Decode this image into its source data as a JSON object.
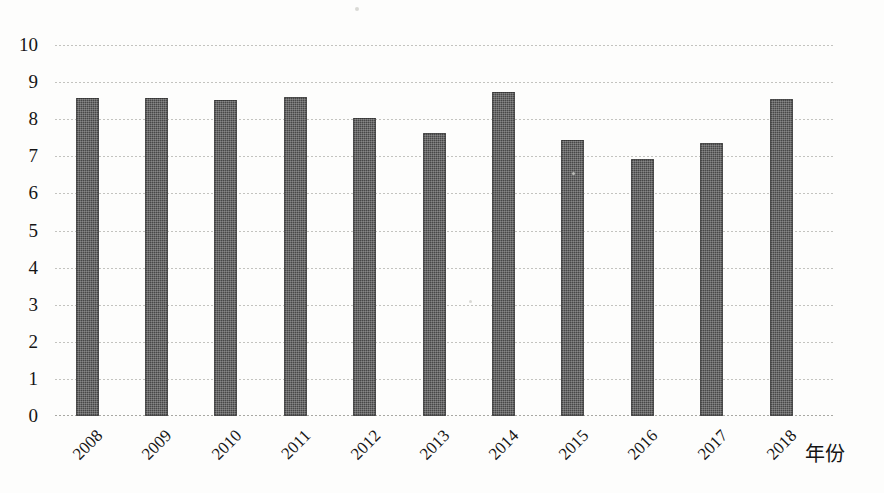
{
  "chart_data": {
    "type": "bar",
    "title": "",
    "subtitle": "",
    "xlabel": "年份",
    "ylabel": "",
    "categories": [
      "2008",
      "2009",
      "2010",
      "2011",
      "2012",
      "2013",
      "2014",
      "2015",
      "2016",
      "2017",
      "2018"
    ],
    "values": [
      8.58,
      8.57,
      8.52,
      8.6,
      8.02,
      7.64,
      8.73,
      7.44,
      6.93,
      7.36,
      8.55
    ],
    "series": [
      {
        "name": "",
        "values": [
          8.58,
          8.57,
          8.52,
          8.6,
          8.02,
          7.64,
          8.73,
          7.44,
          6.93,
          7.36,
          8.55
        ]
      }
    ],
    "ylim": [
      0,
      10
    ],
    "yticks": [
      0,
      1,
      2,
      3,
      4,
      5,
      6,
      7,
      8,
      9,
      10
    ],
    "ytick_labels": [
      "0",
      "1",
      "2",
      "3",
      "4",
      "5",
      "6",
      "7",
      "8",
      "9",
      "10"
    ],
    "grid": true,
    "grid_axis": "y",
    "legend": false,
    "legend_position": "none",
    "bar_color": "#474747",
    "grid_color": "#b9b9b4",
    "background_color": "#fdfdfc",
    "text_color": "#151515",
    "xtick_rotation": -45,
    "annotations": []
  }
}
